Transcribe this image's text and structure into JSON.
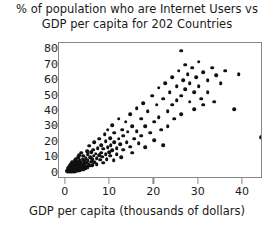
{
  "chart_data": {
    "type": "scatter",
    "title": "% of population who are Internet Users vs GDP per capita for 202 Countries",
    "title_lines": [
      "% of population who are Internet Users vs",
      "GDP per capita for 202 Countries"
    ],
    "xlabel": "GDP per capita (thousands of dollars)",
    "ylabel": "",
    "xlim": [
      -1.5,
      44.5
    ],
    "ylim": [
      -4,
      84
    ],
    "xticks": [
      0,
      10,
      20,
      30,
      40
    ],
    "yticks": [
      0,
      10,
      20,
      30,
      40,
      50,
      60,
      70,
      80
    ],
    "xtick_labels": [
      "0",
      "10",
      "20",
      "30",
      "40"
    ],
    "ytick_labels": [
      "0",
      "10",
      "20",
      "30",
      "40",
      "50",
      "60",
      "70",
      "80"
    ],
    "grid": false,
    "legend": null,
    "n_points": 202,
    "marker": "filled-circle",
    "marker_color": "#111111",
    "frame_color": "#888888",
    "background": "#ffffff",
    "points": [
      [
        0.3,
        1.0
      ],
      [
        0.4,
        1.5
      ],
      [
        0.5,
        0.8
      ],
      [
        0.5,
        2.0
      ],
      [
        0.6,
        1.2
      ],
      [
        0.6,
        3.0
      ],
      [
        0.7,
        0.9
      ],
      [
        0.7,
        2.4
      ],
      [
        0.8,
        1.6
      ],
      [
        0.8,
        4.0
      ],
      [
        0.9,
        1.0
      ],
      [
        0.9,
        2.8
      ],
      [
        1.0,
        0.7
      ],
      [
        1.0,
        2.0
      ],
      [
        1.0,
        5.0
      ],
      [
        1.1,
        1.3
      ],
      [
        1.1,
        3.5
      ],
      [
        1.2,
        0.9
      ],
      [
        1.2,
        2.2
      ],
      [
        1.2,
        6.0
      ],
      [
        1.3,
        1.5
      ],
      [
        1.3,
        4.2
      ],
      [
        1.4,
        1.0
      ],
      [
        1.4,
        2.6
      ],
      [
        1.5,
        0.8
      ],
      [
        1.5,
        3.2
      ],
      [
        1.5,
        7.0
      ],
      [
        1.6,
        1.8
      ],
      [
        1.6,
        5.0
      ],
      [
        1.7,
        1.1
      ],
      [
        1.7,
        2.9
      ],
      [
        1.8,
        0.9
      ],
      [
        1.8,
        4.5
      ],
      [
        1.9,
        2.0
      ],
      [
        1.9,
        6.5
      ],
      [
        2.0,
        1.2
      ],
      [
        2.0,
        3.4
      ],
      [
        2.0,
        8.0
      ],
      [
        2.1,
        1.7
      ],
      [
        2.1,
        5.5
      ],
      [
        2.2,
        1.0
      ],
      [
        2.2,
        2.5
      ],
      [
        2.3,
        4.0
      ],
      [
        2.3,
        9.0
      ],
      [
        2.4,
        1.5
      ],
      [
        2.4,
        6.0
      ],
      [
        2.5,
        2.2
      ],
      [
        2.5,
        3.8
      ],
      [
        2.6,
        1.3
      ],
      [
        2.6,
        7.5
      ],
      [
        2.7,
        2.8
      ],
      [
        2.7,
        5.0
      ],
      [
        2.8,
        1.8
      ],
      [
        2.8,
        10.0
      ],
      [
        2.9,
        3.2
      ],
      [
        2.9,
        6.8
      ],
      [
        3.0,
        2.0
      ],
      [
        3.0,
        4.5
      ],
      [
        3.0,
        11.5
      ],
      [
        3.1,
        1.5
      ],
      [
        3.2,
        5.8
      ],
      [
        3.2,
        8.5
      ],
      [
        3.3,
        2.6
      ],
      [
        3.3,
        4.0
      ],
      [
        3.4,
        7.0
      ],
      [
        3.5,
        1.9
      ],
      [
        3.5,
        3.5
      ],
      [
        3.5,
        13.0
      ],
      [
        3.6,
        5.2
      ],
      [
        3.7,
        2.4
      ],
      [
        3.8,
        9.0
      ],
      [
        3.8,
        6.0
      ],
      [
        3.9,
        3.0
      ],
      [
        4.0,
        4.8
      ],
      [
        4.0,
        11.0
      ],
      [
        4.1,
        2.2
      ],
      [
        4.2,
        7.5
      ],
      [
        4.3,
        5.5
      ],
      [
        4.4,
        3.8
      ],
      [
        4.5,
        9.5
      ],
      [
        4.5,
        2.8
      ],
      [
        4.6,
        6.5
      ],
      [
        4.8,
        14.0
      ],
      [
        4.8,
        4.2
      ],
      [
        5.0,
        8.0
      ],
      [
        5.0,
        12.0
      ],
      [
        5.0,
        3.2
      ],
      [
        5.2,
        6.0
      ],
      [
        5.3,
        17.5
      ],
      [
        5.5,
        10.0
      ],
      [
        5.5,
        4.5
      ],
      [
        5.7,
        7.2
      ],
      [
        5.8,
        13.5
      ],
      [
        6.0,
        9.0
      ],
      [
        6.0,
        5.0
      ],
      [
        6.2,
        15.0
      ],
      [
        6.3,
        11.0
      ],
      [
        6.5,
        7.0
      ],
      [
        6.5,
        20.0
      ],
      [
        6.8,
        12.5
      ],
      [
        7.0,
        9.5
      ],
      [
        7.0,
        5.5
      ],
      [
        7.2,
        16.0
      ],
      [
        7.5,
        11.5
      ],
      [
        7.5,
        22.0
      ],
      [
        7.8,
        8.5
      ],
      [
        8.0,
        13.0
      ],
      [
        8.0,
        18.0
      ],
      [
        8.2,
        10.5
      ],
      [
        8.5,
        15.5
      ],
      [
        8.5,
        6.5
      ],
      [
        8.8,
        25.0
      ],
      [
        9.0,
        12.0
      ],
      [
        9.0,
        20.5
      ],
      [
        9.3,
        9.0
      ],
      [
        9.5,
        16.5
      ],
      [
        9.5,
        28.0
      ],
      [
        9.8,
        13.5
      ],
      [
        10.0,
        11.0
      ],
      [
        10.0,
        22.5
      ],
      [
        10.2,
        18.0
      ],
      [
        10.5,
        31.0
      ],
      [
        10.5,
        14.5
      ],
      [
        10.8,
        8.0
      ],
      [
        11.0,
        20.0
      ],
      [
        11.0,
        26.0
      ],
      [
        11.5,
        16.0
      ],
      [
        11.5,
        12.0
      ],
      [
        12.0,
        35.0
      ],
      [
        12.0,
        22.0
      ],
      [
        12.3,
        18.5
      ],
      [
        12.5,
        10.0
      ],
      [
        12.8,
        28.0
      ],
      [
        13.0,
        24.0
      ],
      [
        13.0,
        15.0
      ],
      [
        13.5,
        33.0
      ],
      [
        13.8,
        20.0
      ],
      [
        14.0,
        26.5
      ],
      [
        14.5,
        38.0
      ],
      [
        14.5,
        17.0
      ],
      [
        15.0,
        30.0
      ],
      [
        15.0,
        13.0
      ],
      [
        15.5,
        22.0
      ],
      [
        16.0,
        42.0
      ],
      [
        16.0,
        27.0
      ],
      [
        16.5,
        19.0
      ],
      [
        17.0,
        35.0
      ],
      [
        17.0,
        24.0
      ],
      [
        17.5,
        45.0
      ],
      [
        18.0,
        30.0
      ],
      [
        18.0,
        16.5
      ],
      [
        18.5,
        40.0
      ],
      [
        19.0,
        26.0
      ],
      [
        19.5,
        50.0
      ],
      [
        20.0,
        33.0
      ],
      [
        20.0,
        21.0
      ],
      [
        20.5,
        44.0
      ],
      [
        21.0,
        55.0
      ],
      [
        21.0,
        36.0
      ],
      [
        21.5,
        28.0
      ],
      [
        22.0,
        48.0
      ],
      [
        22.0,
        18.0
      ],
      [
        22.5,
        58.0
      ],
      [
        23.0,
        40.0
      ],
      [
        23.0,
        30.0
      ],
      [
        23.5,
        52.0
      ],
      [
        24.0,
        62.0
      ],
      [
        24.0,
        44.0
      ],
      [
        24.5,
        35.0
      ],
      [
        25.0,
        56.0
      ],
      [
        25.0,
        47.0
      ],
      [
        25.5,
        66.0
      ],
      [
        26.0,
        79.0
      ],
      [
        26.0,
        50.0
      ],
      [
        26.0,
        38.0
      ],
      [
        26.5,
        60.0
      ],
      [
        27.0,
        70.0
      ],
      [
        27.0,
        54.0
      ],
      [
        27.5,
        64.0
      ],
      [
        28.0,
        46.0
      ],
      [
        28.0,
        58.0
      ],
      [
        28.5,
        68.0
      ],
      [
        29.0,
        52.0
      ],
      [
        29.0,
        41.0
      ],
      [
        29.5,
        62.0
      ],
      [
        30.0,
        72.0
      ],
      [
        30.0,
        56.0
      ],
      [
        30.5,
        48.0
      ],
      [
        31.0,
        65.0
      ],
      [
        31.0,
        44.0
      ],
      [
        32.0,
        60.0
      ],
      [
        32.0,
        52.0
      ],
      [
        33.0,
        68.0
      ],
      [
        33.5,
        46.0
      ],
      [
        34.0,
        63.0
      ],
      [
        35.0,
        58.0
      ],
      [
        36.0,
        66.0
      ],
      [
        38.0,
        41.0
      ],
      [
        39.0,
        64.0
      ],
      [
        44.0,
        23.0
      ]
    ]
  }
}
